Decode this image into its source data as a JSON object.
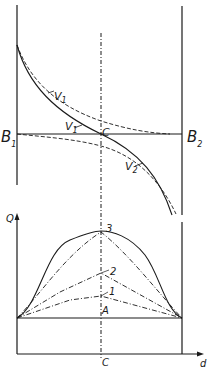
{
  "figure": {
    "colors": {
      "ink": "#1a1a1a",
      "background": "#ffffff"
    },
    "top_panel": {
      "left_boundary_label": "B",
      "left_boundary_sub": "1",
      "right_boundary_label": "B",
      "right_boundary_sub": "2",
      "center_point_label": "C",
      "curve_labels": [
        {
          "name": "V",
          "sub": "1",
          "style": "dashed-upper"
        },
        {
          "name": "V",
          "sub": "1",
          "style": "solid"
        },
        {
          "name": "V",
          "sub": "2",
          "style": "solid/dashed-lower"
        }
      ]
    },
    "bottom_panel": {
      "y_axis_label": "Q",
      "x_axis_label": "d",
      "center_tick_label": "C",
      "baseline_label": "A",
      "curve_labels": [
        "1",
        "2",
        "3"
      ]
    }
  }
}
